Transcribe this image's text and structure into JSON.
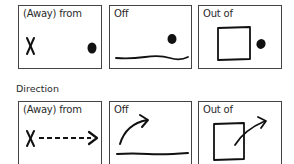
{
  "rows": [
    {
      "name": "position",
      "panels": [
        {
          "label": "(Away) from",
          "illustration": "x-mark-and-dot"
        },
        {
          "label": "Off",
          "illustration": "dot-above-line"
        },
        {
          "label": "Out of",
          "illustration": "dot-outside-square"
        }
      ]
    },
    {
      "name": "direction",
      "section_label": "Direction",
      "panels": [
        {
          "label": "(Away) from",
          "illustration": "dashed-arrow-from-x"
        },
        {
          "label": "Off",
          "illustration": "curved-arrow-off-line"
        },
        {
          "label": "Out of",
          "illustration": "arrow-exiting-square"
        }
      ]
    }
  ],
  "colors": {
    "ink": "#111111",
    "border": "#444444",
    "background": "#ffffff"
  }
}
